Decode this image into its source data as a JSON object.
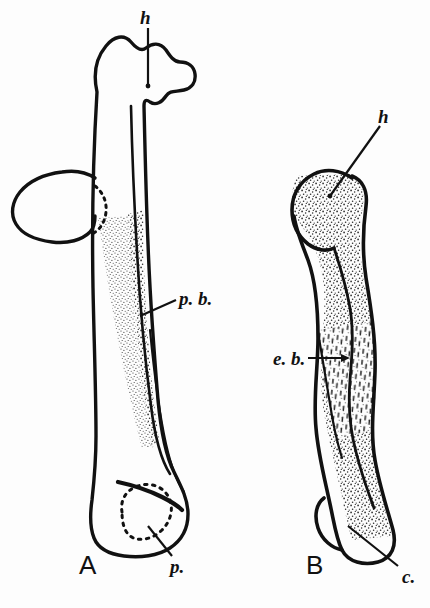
{
  "plate": {
    "background_color": "#fdfdfd",
    "ink_color": "#111111",
    "stipple_color": "#2b2b2b",
    "width": 430,
    "height": 608
  },
  "figures": [
    {
      "id": "A",
      "label": "A",
      "description": "left bone, lateral view with pneumatic foramen"
    },
    {
      "id": "B",
      "label": "B",
      "description": "right bone, shorter stippled view with ectepicondylar border"
    }
  ],
  "annotations": [
    {
      "key": "h-a",
      "label": "h",
      "figure": "A",
      "leader": "vertical"
    },
    {
      "key": "h-b",
      "label": "h",
      "figure": "B",
      "leader": "diagonal"
    },
    {
      "key": "p-b",
      "label": "p. b.",
      "figure": "A",
      "leader": "diagonal"
    },
    {
      "key": "e-b",
      "label": "e. b.",
      "figure": "B",
      "leader": "horizontal"
    },
    {
      "key": "p",
      "label": "p.",
      "figure": "A",
      "leader": "diagonal"
    },
    {
      "key": "c",
      "label": "c.",
      "figure": "B",
      "leader": "diagonal"
    }
  ]
}
